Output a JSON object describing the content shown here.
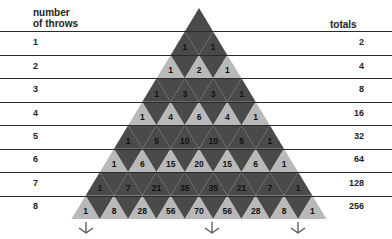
{
  "headers": {
    "left": "number\nof throws",
    "left_line1": "number",
    "left_line2": "of throws",
    "right": "totals"
  },
  "rows": [
    {
      "throws": "1",
      "values": [
        1,
        1
      ],
      "total": "2"
    },
    {
      "throws": "2",
      "values": [
        1,
        2,
        1
      ],
      "total": "4"
    },
    {
      "throws": "3",
      "values": [
        1,
        3,
        3,
        1
      ],
      "total": "8"
    },
    {
      "throws": "4",
      "values": [
        1,
        4,
        6,
        4,
        1
      ],
      "total": "16"
    },
    {
      "throws": "5",
      "values": [
        1,
        5,
        10,
        10,
        5,
        1
      ],
      "total": "32"
    },
    {
      "throws": "6",
      "values": [
        1,
        6,
        15,
        20,
        15,
        6,
        1
      ],
      "total": "64"
    },
    {
      "throws": "7",
      "values": [
        1,
        7,
        21,
        35,
        35,
        21,
        7,
        1
      ],
      "total": "128"
    },
    {
      "throws": "8",
      "values": [
        1,
        8,
        28,
        56,
        70,
        56,
        28,
        8,
        1
      ],
      "total": "256"
    }
  ],
  "colors": {
    "dark": "#4a4a4a",
    "light": "#b9b9b9",
    "line": "#2a2a2a"
  }
}
